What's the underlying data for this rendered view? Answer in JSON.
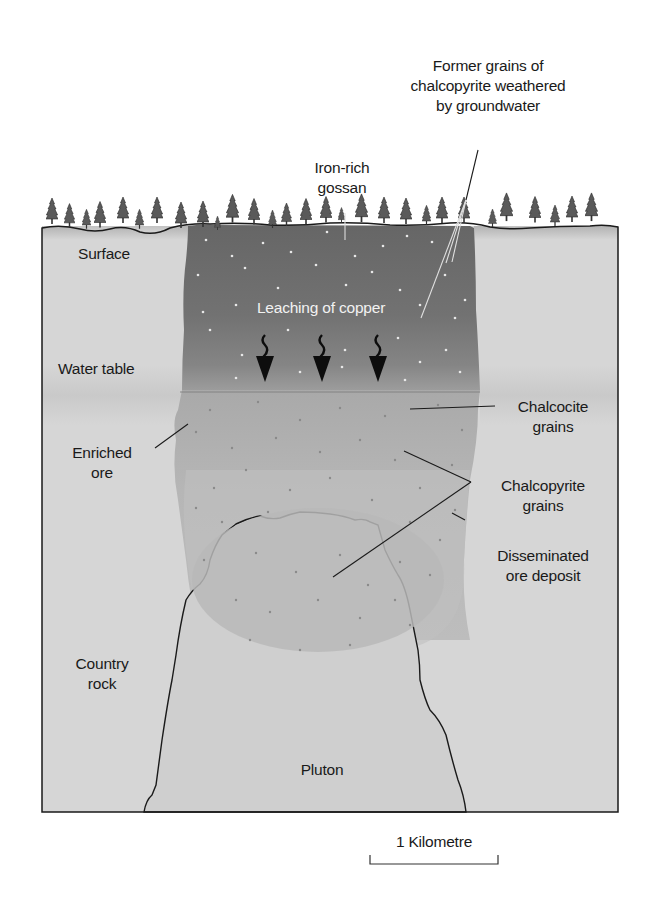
{
  "diagram": {
    "labels": {
      "former_grains": [
        "Former grains of",
        "chalcopyrite weathered",
        "by groundwater"
      ],
      "gossan": [
        "Iron-rich",
        "gossan"
      ],
      "surface": "Surface",
      "leaching": "Leaching of copper",
      "water_table": "Water table",
      "chalcocite": [
        "Chalcocite",
        "grains"
      ],
      "enriched_ore": [
        "Enriched",
        "ore"
      ],
      "chalcopyrite": [
        "Chalcopyrite",
        "grains"
      ],
      "disseminated": [
        "Disseminated",
        "ore deposit"
      ],
      "country_rock": [
        "Country",
        "rock"
      ],
      "pluton": "Pluton"
    },
    "scale_bar": {
      "label": "1 Kilometre"
    },
    "colors": {
      "country_rock": "#d6d6d6",
      "gossan": "#6e6e6e",
      "gossan_lower": "#888888",
      "enriched_zone": "#b3b3b3",
      "disseminated_zone": "#c2c2c2",
      "pluton": "#cfcfcf",
      "outline": "#1a1a1a",
      "tree": "#555555",
      "text": "#1a1a1a",
      "text_light": "#f2f2f2"
    },
    "icons": [
      "tree-icon",
      "wavy-arrow-down-icon"
    ]
  }
}
